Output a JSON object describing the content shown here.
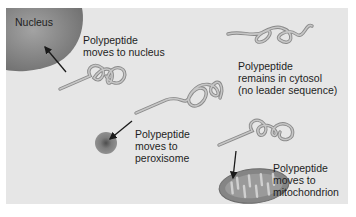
{
  "diagram": {
    "colors": {
      "background": "#e6e6e6",
      "nucleus": "#8d8d8d",
      "peroxisome": "#7a7a7a",
      "mitochondrion_outer": "#8a8a8a",
      "mitochondrion_inner": "#c4c4c4",
      "polypeptide": "#a9a9a9",
      "arrow": "#1a1a1a"
    },
    "structures": {
      "nucleus": {
        "label": "Nucleus"
      },
      "peroxisome": {
        "label": ""
      },
      "mitochondrion": {
        "label": ""
      }
    },
    "annotations": [
      {
        "id": "nucleus",
        "lines": [
          "Polypeptide",
          "moves to nucleus"
        ]
      },
      {
        "id": "cytosol",
        "lines": [
          "Polypeptide",
          "remains in cytosol",
          "(no leader sequence)"
        ]
      },
      {
        "id": "peroxisome",
        "lines": [
          "Polypeptide",
          "moves to",
          "peroxisome"
        ]
      },
      {
        "id": "mitochondrion",
        "lines": [
          "Polypeptide",
          "moves to",
          "mitochondrion"
        ]
      }
    ]
  }
}
